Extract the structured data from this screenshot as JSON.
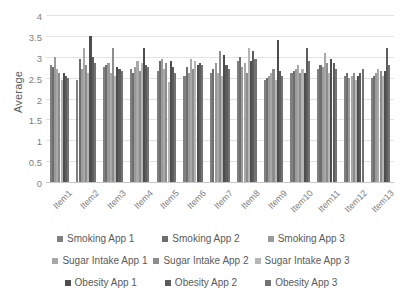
{
  "chart_data": {
    "type": "bar",
    "title": "",
    "xlabel": "",
    "ylabel": "Average",
    "ylim": [
      0,
      4
    ],
    "ytick_values": [
      0,
      0.5,
      1,
      1.5,
      2,
      2.5,
      3,
      3.5,
      4
    ],
    "ytick_labels": [
      "0",
      "0.5",
      "1",
      "1.5",
      "2",
      "2.5",
      "3",
      "3.5",
      "4"
    ],
    "grid": true,
    "legend_position": "bottom",
    "categories": [
      "Item1",
      "Item2",
      "Item3",
      "Item4",
      "Item5",
      "Item6",
      "Item7",
      "Item8",
      "Item9",
      "Item10",
      "Item11",
      "Item12",
      "Item13"
    ],
    "series": [
      {
        "name": "Smoking App 1",
        "color": "#808080",
        "values": [
          2.8,
          2.45,
          2.75,
          2.7,
          2.65,
          2.55,
          2.6,
          2.9,
          2.45,
          2.6,
          2.7,
          2.55,
          2.5
        ]
      },
      {
        "name": "Smoking App 2",
        "color": "#6e6e6e",
        "values": [
          2.75,
          2.95,
          2.8,
          2.6,
          2.9,
          2.75,
          2.7,
          3.0,
          2.5,
          2.65,
          2.8,
          2.6,
          2.55
        ]
      },
      {
        "name": "Smoking App 3",
        "color": "#9a9a9a",
        "values": [
          3.0,
          2.7,
          2.85,
          2.75,
          2.95,
          2.6,
          2.85,
          2.75,
          2.55,
          2.7,
          2.75,
          2.5,
          2.6
        ]
      },
      {
        "name": "Sugar Intake App 1",
        "color": "#a8a8a8",
        "values": [
          2.7,
          3.2,
          2.6,
          2.9,
          2.7,
          2.95,
          2.6,
          2.85,
          2.6,
          2.8,
          3.1,
          2.55,
          2.7
        ]
      },
      {
        "name": "Sugar Intake App 2",
        "color": "#8d8d8d",
        "values": [
          2.6,
          2.8,
          3.2,
          2.65,
          2.85,
          2.7,
          3.15,
          2.6,
          2.7,
          2.6,
          2.85,
          2.6,
          2.65
        ]
      },
      {
        "name": "Sugar Intake App 3",
        "color": "#b5b5b5",
        "values": [
          2.45,
          2.6,
          2.55,
          2.85,
          2.4,
          2.9,
          2.55,
          3.2,
          2.45,
          2.7,
          2.6,
          2.45,
          2.55
        ]
      },
      {
        "name": "Obesity App 1",
        "color": "#4d4d4d",
        "values": [
          2.6,
          3.5,
          2.75,
          3.2,
          2.9,
          2.8,
          3.05,
          2.9,
          3.4,
          2.6,
          2.95,
          2.55,
          2.65
        ]
      },
      {
        "name": "Obesity App 2",
        "color": "#5c5c5c",
        "values": [
          2.55,
          3.0,
          2.7,
          2.8,
          2.75,
          2.85,
          2.8,
          3.15,
          2.65,
          3.2,
          2.85,
          2.6,
          3.2
        ]
      },
      {
        "name": "Obesity App 3",
        "color": "#737373",
        "values": [
          2.5,
          2.85,
          2.65,
          2.75,
          2.6,
          2.8,
          2.7,
          2.95,
          2.55,
          2.9,
          2.7,
          2.7,
          2.8
        ]
      }
    ]
  },
  "legend": {
    "rows": [
      [
        "Smoking App 1",
        "Smoking App 2",
        "Smoking App 3"
      ],
      [
        "Sugar Intake App 1",
        "Sugar Intake App 2",
        "Sugar Intake App 3"
      ],
      [
        "Obesity App 1",
        "Obesity App 2",
        "Obesity App 3"
      ]
    ]
  }
}
